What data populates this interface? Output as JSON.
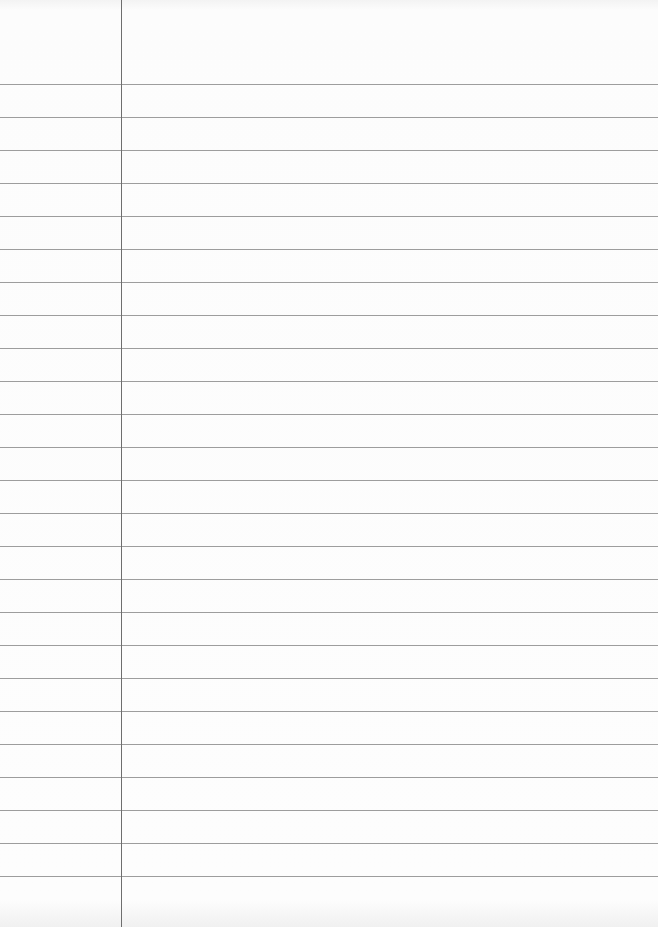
{
  "page": {
    "type": "lined-notebook-paper",
    "background_color": "#fbfbfb",
    "rule_color": "#8c8c8c",
    "margin_color": "#6e6e6e",
    "margin_x": 121,
    "first_rule_y": 84,
    "rule_spacing": 33,
    "rule_count": 25
  }
}
